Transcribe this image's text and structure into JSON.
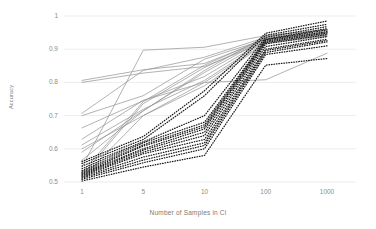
{
  "chart_data": {
    "type": "line",
    "title": "",
    "xlabel": "Number of Samples in Ci",
    "ylabel": "Accuracy",
    "x_tick_labels": [
      "1",
      "5",
      "10",
      "100",
      "1000"
    ],
    "x_values": [
      1,
      5,
      10,
      100,
      1000
    ],
    "x_scale": "categorical",
    "y_tick_labels": [
      "0.5",
      "0.6",
      "0.7",
      "0.8",
      "0.9",
      "1"
    ],
    "y_tick_values": [
      0.5,
      0.6,
      0.7,
      0.8,
      0.9,
      1.0
    ],
    "ylim": [
      0.5,
      1.0
    ],
    "grid": "horizontal",
    "legend": "none",
    "groups": [
      {
        "name": "solid-gray-series",
        "style": "solid",
        "color": "#9a9a9a",
        "series": [
          {
            "name": "g1",
            "values": [
              0.806,
              0.838,
              0.857,
              0.93,
              0.951
            ]
          },
          {
            "name": "g2",
            "values": [
              0.8,
              0.828,
              0.848,
              0.922,
              0.944
            ]
          },
          {
            "name": "g3",
            "values": [
              0.707,
              0.836,
              0.876,
              0.936,
              0.957
            ]
          },
          {
            "name": "g4",
            "values": [
              0.7,
              0.76,
              0.87,
              0.93,
              0.948
            ]
          },
          {
            "name": "g5",
            "values": [
              0.663,
              0.745,
              0.818,
              0.928,
              0.945
            ]
          },
          {
            "name": "g6",
            "values": [
              0.629,
              0.746,
              0.8,
              0.808,
              0.888
            ]
          },
          {
            "name": "g7",
            "values": [
              0.612,
              0.719,
              0.806,
              0.925,
              0.94
            ]
          },
          {
            "name": "g8",
            "values": [
              0.6,
              0.7,
              0.79,
              0.918,
              0.938
            ]
          },
          {
            "name": "g9",
            "values": [
              0.59,
              0.715,
              0.83,
              0.932,
              0.95
            ]
          },
          {
            "name": "g10",
            "values": [
              0.566,
              0.714,
              0.836,
              0.94,
              0.96
            ]
          },
          {
            "name": "g11",
            "values": [
              0.545,
              0.897,
              0.906,
              0.941,
              0.958
            ]
          },
          {
            "name": "g12",
            "values": [
              0.528,
              0.742,
              0.852,
              0.934,
              0.952
            ]
          },
          {
            "name": "g13",
            "values": [
              0.52,
              0.736,
              0.845,
              0.93,
              0.947
            ]
          },
          {
            "name": "g14",
            "values": [
              0.512,
              0.7,
              0.8,
              0.92,
              0.942
            ]
          }
        ]
      },
      {
        "name": "dotted-black-series",
        "style": "dotted",
        "color": "#1a1a1a",
        "series": [
          {
            "name": "d1",
            "values": [
              0.562,
              0.637,
              0.775,
              0.948,
              0.985
            ]
          },
          {
            "name": "d2",
            "values": [
              0.556,
              0.628,
              0.76,
              0.942,
              0.975
            ]
          },
          {
            "name": "d3",
            "values": [
              0.548,
              0.621,
              0.7,
              0.936,
              0.968
            ]
          },
          {
            "name": "d4",
            "values": [
              0.54,
              0.618,
              0.68,
              0.93,
              0.962
            ]
          },
          {
            "name": "d5",
            "values": [
              0.534,
              0.612,
              0.672,
              0.928,
              0.958
            ]
          },
          {
            "name": "d6",
            "values": [
              0.53,
              0.608,
              0.666,
              0.924,
              0.953
            ]
          },
          {
            "name": "d7",
            "values": [
              0.527,
              0.6,
              0.66,
              0.92,
              0.949
            ]
          },
          {
            "name": "d8",
            "values": [
              0.524,
              0.596,
              0.65,
              0.916,
              0.944
            ]
          },
          {
            "name": "d9",
            "values": [
              0.521,
              0.59,
              0.64,
              0.908,
              0.938
            ]
          },
          {
            "name": "d10",
            "values": [
              0.518,
              0.585,
              0.628,
              0.9,
              0.93
            ]
          },
          {
            "name": "d11",
            "values": [
              0.515,
              0.575,
              0.618,
              0.896,
              0.926
            ]
          },
          {
            "name": "d12",
            "values": [
              0.512,
              0.566,
              0.61,
              0.89,
              0.922
            ]
          },
          {
            "name": "d13",
            "values": [
              0.508,
              0.558,
              0.6,
              0.884,
              0.91
            ]
          },
          {
            "name": "d14",
            "values": [
              0.503,
              0.545,
              0.58,
              0.852,
              0.872
            ]
          }
        ]
      }
    ]
  },
  "axes": {
    "grid_color": "#ededed",
    "tick_text_color": "#8c8c8c",
    "axis_label_color": "#7a7a7a"
  }
}
